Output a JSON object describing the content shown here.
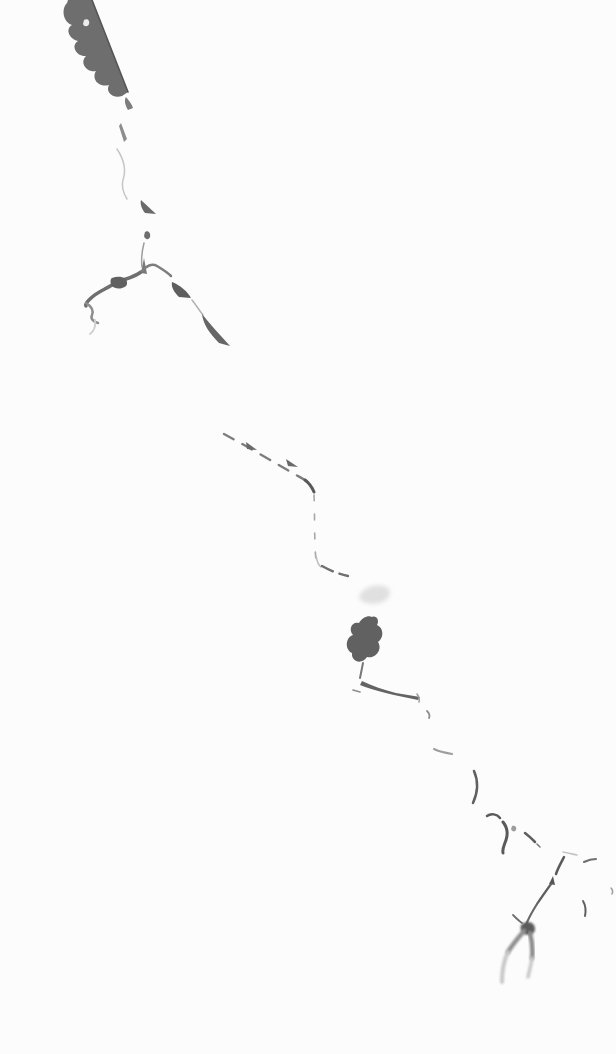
{
  "meta": {
    "orientation": "diagonal, top-left to bottom-right"
  },
  "colors": {
    "background": "#fcfcfc",
    "crack_dark": "#5a5a5a",
    "crack_mid": "#8a8a8a",
    "crack_faint": "#c2c2c2",
    "smudge": "#e0e0e0"
  },
  "crack": {
    "segments": [
      {
        "name": "top-mass",
        "type": "fill",
        "color": "#6e6e6e",
        "d": "M92,0 L128,92 L122,96 C113,99 105,92 109,85 C99,88 91,79 96,71 C87,73 79,63 86,56 C77,57 70,46 78,41 C69,39 65,29 72,25 C63,22 61,9 67,3 L68,0 Z"
      },
      {
        "name": "top-mass-edge",
        "type": "stroke",
        "color": "#565656",
        "width": 1.6,
        "d": "M92,0 L128,92"
      },
      {
        "name": "white-fleck",
        "type": "fill",
        "color": "#ededed",
        "d": "M84,20 C87,18 90,20 89,24 C88,27 84,27 83,24 Z"
      },
      {
        "name": "sliver-1",
        "type": "fill",
        "color": "#7d7d7d",
        "d": "M126,97 C129,101 132,104 133,108 L128,110 C125,105 124,100 126,97 Z"
      },
      {
        "name": "sliver-2",
        "type": "fill",
        "color": "#8d8d8d",
        "d": "M121,123 L127,139 L124,142 L119,126 Z"
      },
      {
        "name": "faint-curve",
        "type": "stroke",
        "color": "#c6c6c6",
        "width": 1.5,
        "d": "M117,149 C123,158 127,168 123,180 C121,187 124,194 127,199"
      },
      {
        "name": "triangle-1",
        "type": "fill",
        "color": "#6a6a6a",
        "d": "M141,200 L156,214 L145,213 C141,208 140,203 141,200 Z"
      },
      {
        "name": "dot-1",
        "type": "fill",
        "color": "#6e6e6e",
        "d": "M145,232 C148,230 151,233 150,237 C149,240 145,240 144,236 Z"
      },
      {
        "name": "thin-line-1",
        "type": "stroke",
        "color": "#9d9d9d",
        "width": 1.5,
        "d": "M144,243 C142,251 141,259 142,267"
      },
      {
        "name": "spike-up",
        "type": "fill",
        "color": "#7a7a7a",
        "d": "M144,258 L147,274 L141,273 Z"
      },
      {
        "name": "branch-left",
        "type": "stroke",
        "color": "#6f6f6f",
        "width": 3.5,
        "d": "M141,272 C130,280 120,279 112,285 C104,290 97,292 90,299 C87,302 85,304 86,306"
      },
      {
        "name": "branch-left-blob",
        "type": "fill",
        "color": "#616161",
        "d": "M112,278 C119,275 128,277 127,284 C126,289 115,290 112,286 C110,283 110,279 112,278 Z"
      },
      {
        "name": "branch-left-hook",
        "type": "stroke",
        "color": "#8d8d8d",
        "width": 2.5,
        "d": "M86,303 C91,306 94,310 92,315 C90,319 94,322 98,323"
      },
      {
        "name": "branch-left-curl",
        "type": "stroke",
        "color": "#d0d0d0",
        "width": 2,
        "d": "M95,320 C96,326 94,331 90,334"
      },
      {
        "name": "junction-arc",
        "type": "stroke",
        "color": "#7d7d7d",
        "width": 2.5,
        "d": "M142,271 C146,266 152,263 157,266 C162,269 167,272 171,276"
      },
      {
        "name": "triangle-2",
        "type": "fill",
        "color": "#5e5e5e",
        "d": "M172,282 C180,285 188,292 191,298 L179,297 C174,292 171,287 172,282 Z"
      },
      {
        "name": "link-thin",
        "type": "stroke",
        "color": "#b2b2b2",
        "width": 1.5,
        "d": "M192,300 C196,305 199,310 203,315"
      },
      {
        "name": "wedge",
        "type": "fill",
        "color": "#666666",
        "d": "M202,314 C210,324 220,335 230,346 L219,343 C210,334 203,324 202,314 Z"
      },
      {
        "name": "dash-diag",
        "type": "stroke",
        "color": "#7d7d7d",
        "width": 2.4,
        "dash": "11 10",
        "d": "M224,434 C252,449 282,467 312,484"
      },
      {
        "name": "dash-tri-a",
        "type": "fill",
        "color": "#696969",
        "d": "M246,442 L257,450 L247,449 Z"
      },
      {
        "name": "dash-tri-b",
        "type": "fill",
        "color": "#696969",
        "d": "M286,459 L298,467 L288,466 Z"
      },
      {
        "name": "corner-dark",
        "type": "stroke",
        "color": "#585858",
        "width": 3,
        "d": "M305,480 C309,483 312,487 314,492"
      },
      {
        "name": "dash-vert",
        "type": "stroke",
        "color": "#a8a8a8",
        "width": 1.6,
        "dash": "6 13",
        "d": "M314,495 C315,515 314,540 316,561"
      },
      {
        "name": "corner-2",
        "type": "stroke",
        "color": "#bdbdbd",
        "width": 1.5,
        "d": "M316,556 C317,561 318,565 321,567"
      },
      {
        "name": "dash-bottom",
        "type": "stroke",
        "color": "#6f6f6f",
        "width": 2.4,
        "dash": "12 7",
        "d": "M322,566 C331,571 339,574 348,576"
      },
      {
        "name": "smudge",
        "type": "fill",
        "color": "#e0e0e0",
        "blur": "blur2",
        "d": "M359,597 C361,588 376,583 386,587 C393,590 390,600 380,603 C371,605 360,603 359,597 Z"
      },
      {
        "name": "cloud-blob",
        "type": "fill",
        "color": "#616161",
        "d": "M372,617 C376,615 380,620 377,625 C384,628 384,638 378,642 C383,650 375,659 367,657 C362,665 351,662 352,653 C344,649 346,637 353,635 C348,629 352,621 359,623 C362,618 368,615 372,617 Z"
      },
      {
        "name": "blob-tail",
        "type": "stroke",
        "color": "#787878",
        "width": 2,
        "d": "M363,663 C362,668 361,673 360,678"
      },
      {
        "name": "streak",
        "type": "fill",
        "color": "#646464",
        "d": "M362,681 C372,686 384,690 396,693 L420,697 L418,700 L394,695 C380,692 368,688 360,685 Z"
      },
      {
        "name": "streak-dash",
        "type": "stroke",
        "color": "#8d8d8d",
        "width": 1.6,
        "d": "M353,690 L360,692"
      },
      {
        "name": "streak-fork",
        "type": "stroke",
        "color": "#9a9a9a",
        "width": 1.5,
        "d": "M417,694 C419,697 420,699 419,702"
      },
      {
        "name": "tick-1",
        "type": "stroke",
        "color": "#8d8d8d",
        "width": 1.8,
        "d": "M427,711 C429,713 430,716 429,718"
      },
      {
        "name": "faint-dash-2",
        "type": "stroke",
        "color": "#9d9d9d",
        "width": 2,
        "d": "M434,749 C440,752 446,753 452,754"
      },
      {
        "name": "vert-stroke-1",
        "type": "stroke",
        "color": "#606060",
        "width": 2.5,
        "d": "M474,771 C478,780 478,792 473,803"
      },
      {
        "name": "hook-top",
        "type": "stroke",
        "color": "#5a5a5a",
        "width": 2.5,
        "d": "M487,816 C491,813 497,814 500,818"
      },
      {
        "name": "hook-down",
        "type": "stroke",
        "color": "#5a5a5a",
        "width": 3,
        "d": "M503,822 C507,827 508,834 506,840 C504,846 502,849 503,853"
      },
      {
        "name": "dot-2",
        "type": "fill",
        "color": "#9d9d9d",
        "d": "M512,826 C515,825 517,827 516,830 C515,832 512,832 511,829 Z"
      },
      {
        "name": "mid-dash",
        "type": "stroke",
        "color": "#5e5e5e",
        "width": 2.5,
        "d": "M525,833 C529,836 532,839 535,842"
      },
      {
        "name": "mid-tick",
        "type": "stroke",
        "color": "#787878",
        "width": 1.5,
        "d": "M537,844 L540,847"
      },
      {
        "name": "faint-dash-3",
        "type": "stroke",
        "color": "#c2c2c2",
        "width": 1.5,
        "d": "M563,852 C568,853 572,854 577,855"
      },
      {
        "name": "stroke-ne",
        "type": "stroke",
        "color": "#5a5a5a",
        "width": 2.5,
        "d": "M564,857 C561,863 558,868 556,874"
      },
      {
        "name": "edge-dash",
        "type": "stroke",
        "color": "#6f6f6f",
        "width": 2,
        "d": "M584,862 C588,860 592,859 596,859"
      },
      {
        "name": "tiny-right",
        "type": "stroke",
        "color": "#9d9d9d",
        "width": 1.5,
        "d": "M611,888 C613,890 613,892 612,894"
      },
      {
        "name": "btm-tip",
        "type": "fill",
        "color": "#565656",
        "d": "M549,884 L553,876 L555,885 Z"
      },
      {
        "name": "btm-diag",
        "type": "stroke",
        "color": "#5f5f5f",
        "width": 2.2,
        "d": "M551,884 C546,891 541,898 537,904"
      },
      {
        "name": "btm-cont",
        "type": "stroke",
        "color": "#6a6a6a",
        "width": 2.2,
        "d": "M537,904 C532,912 528,919 526,925"
      },
      {
        "name": "btm-twig",
        "type": "stroke",
        "color": "#6f6f6f",
        "width": 1.8,
        "d": "M513,915 C516,918 519,921 522,923"
      },
      {
        "name": "btm-knot",
        "type": "fill",
        "color": "#5a5a5a",
        "blur": "blur1",
        "d": "M522,924 C527,920 535,922 535,929 C535,935 526,937 522,932 C520,929 520,926 522,924 Z"
      },
      {
        "name": "v-left-a",
        "type": "stroke",
        "color": "#8f8f8f",
        "width": 4.5,
        "blur": "blur1",
        "d": "M524,931 C518,938 512,945 508,952"
      },
      {
        "name": "v-left-b",
        "type": "stroke",
        "color": "#c8c8c8",
        "width": 4,
        "blur": "blur1",
        "d": "M508,952 C504,960 502,970 502,982"
      },
      {
        "name": "v-right-a",
        "type": "stroke",
        "color": "#8a8a8a",
        "width": 4.5,
        "blur": "blur1",
        "d": "M530,933 C532,941 533,950 532,958"
      },
      {
        "name": "v-right-b",
        "type": "stroke",
        "color": "#c8c8c8",
        "width": 3.5,
        "blur": "blur1",
        "d": "M532,958 C531,966 529,972 528,977"
      },
      {
        "name": "vert-stroke-2",
        "type": "stroke",
        "color": "#606060",
        "width": 2,
        "d": "M583,901 C586,906 586,911 585,916"
      }
    ]
  }
}
